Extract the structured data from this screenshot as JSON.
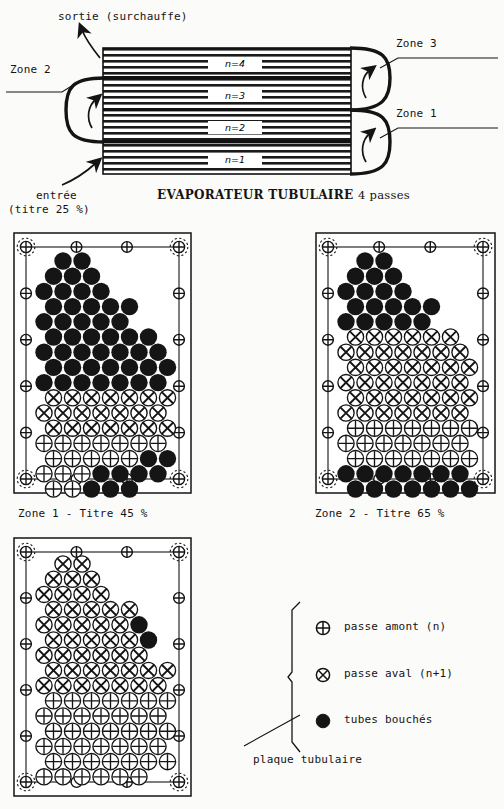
{
  "figure": {
    "title": "EVAPORATEUR TUBULAIRE 4 passes",
    "title_main": "EVAPORATEUR TUBULAIRE",
    "title_tail": "4 passes"
  },
  "schematic": {
    "outlet_label": "sortie (surchauffe)",
    "inlet_label_line1": "entrée",
    "inlet_label_line2": "(titre 25 %)",
    "zone_left": "Zone 2",
    "zone_top_right": "Zone 3",
    "zone_bottom_right": "Zone 1",
    "passes": [
      {
        "label": "n=4"
      },
      {
        "label": "n=3"
      },
      {
        "label": "n=2"
      },
      {
        "label": "n=1"
      }
    ]
  },
  "panels": [
    {
      "id": "zone1",
      "caption": "Zone 1 - Titre 45 %"
    },
    {
      "id": "zone2",
      "caption": "Zone 2 - Titre 65 %"
    },
    {
      "id": "zone3",
      "caption": ""
    }
  ],
  "legend": {
    "items": [
      {
        "symbol": "circle-plus-icon",
        "label": "passe amont (n)"
      },
      {
        "symbol": "circle-cross-icon",
        "label": "passe aval (n+1)"
      },
      {
        "symbol": "filled-circle-icon",
        "label": "tubes bouchés"
      }
    ]
  },
  "annotations": {
    "tubesheet_callout": "plaque tubulaire"
  },
  "colors": {
    "ink": "#141414",
    "paper": "#fbfbf9",
    "blocked": "#151515"
  },
  "tube_maps": {
    "legend_key": {
      "P": "passe amont (n)",
      "X": "passe aval (n+1)",
      "B": "tubes bouchés"
    },
    "zone1": [
      {
        "y": 0,
        "x0": 1,
        "cells": "BB"
      },
      {
        "y": 1,
        "x0": 0,
        "cells": "BBB"
      },
      {
        "y": 2,
        "x0": 0,
        "cells": "BBBB"
      },
      {
        "y": 3,
        "x0": 0,
        "cells": "BBBBB"
      },
      {
        "y": 4,
        "x0": 0,
        "cells": "BBBBB"
      },
      {
        "y": 5,
        "x0": 0,
        "cells": "BBBBBB"
      },
      {
        "y": 6,
        "x0": 0,
        "cells": "BBBBBBB"
      },
      {
        "y": 7,
        "x0": 0,
        "cells": "BBBBBBB"
      },
      {
        "y": 8,
        "x0": 0,
        "cells": "BBBBBBB"
      },
      {
        "y": 9,
        "x0": 0,
        "cells": "XXXXXXX"
      },
      {
        "y": 10,
        "x0": 0,
        "cells": "XXXXXXX"
      },
      {
        "y": 11,
        "x0": 0,
        "cells": "XXXXXXX"
      },
      {
        "y": 12,
        "x0": 0,
        "cells": "PPPPPPP"
      },
      {
        "y": 13,
        "x0": 0,
        "cells": "PPPPPBB"
      },
      {
        "y": 14,
        "x0": 0,
        "cells": "PPPBBBB"
      },
      {
        "y": 15,
        "x0": 0,
        "cells": "PPBBB"
      }
    ],
    "zone2": [
      {
        "y": 0,
        "x0": 1,
        "cells": "BB"
      },
      {
        "y": 1,
        "x0": 0,
        "cells": "BBB"
      },
      {
        "y": 2,
        "x0": 0,
        "cells": "BBBB"
      },
      {
        "y": 3,
        "x0": 0,
        "cells": "BBBBB"
      },
      {
        "y": 4,
        "x0": 0,
        "cells": "BBBBB"
      },
      {
        "y": 5,
        "x0": 0,
        "cells": "XXXXXX"
      },
      {
        "y": 6,
        "x0": 0,
        "cells": "XXXXXXX"
      },
      {
        "y": 7,
        "x0": 0,
        "cells": "XXXXXXX"
      },
      {
        "y": 8,
        "x0": 0,
        "cells": "XXXXXXX"
      },
      {
        "y": 9,
        "x0": 0,
        "cells": "XXXXXXX"
      },
      {
        "y": 10,
        "x0": 0,
        "cells": "XXXXXXX"
      },
      {
        "y": 11,
        "x0": 0,
        "cells": "PPPPPPP"
      },
      {
        "y": 12,
        "x0": 0,
        "cells": "PPPPPPP"
      },
      {
        "y": 13,
        "x0": 0,
        "cells": "PPPPPPP"
      },
      {
        "y": 14,
        "x0": 0,
        "cells": "BBBBBBB"
      },
      {
        "y": 15,
        "x0": 0,
        "cells": "BBBBBBB"
      }
    ],
    "zone3": [
      {
        "y": 0,
        "x0": 1,
        "cells": "XX"
      },
      {
        "y": 1,
        "x0": 0,
        "cells": "XXX"
      },
      {
        "y": 2,
        "x0": 0,
        "cells": "XXXX"
      },
      {
        "y": 3,
        "x0": 0,
        "cells": "XXXXX"
      },
      {
        "y": 4,
        "x0": 0,
        "cells": "XXXXXB"
      },
      {
        "y": 5,
        "x0": 0,
        "cells": "XXXXXB"
      },
      {
        "y": 6,
        "x0": 0,
        "cells": "XXXXXX"
      },
      {
        "y": 7,
        "x0": 0,
        "cells": "XXXXXXX"
      },
      {
        "y": 8,
        "x0": 0,
        "cells": "XXXXXXX"
      },
      {
        "y": 9,
        "x0": 0,
        "cells": "PPPPPPP"
      },
      {
        "y": 10,
        "x0": 0,
        "cells": "PPPPPPP"
      },
      {
        "y": 11,
        "x0": 0,
        "cells": "PPPPPPP"
      },
      {
        "y": 12,
        "x0": 0,
        "cells": "PPPPPPP"
      },
      {
        "y": 13,
        "x0": 0,
        "cells": "PPPPPPP"
      },
      {
        "y": 14,
        "x0": 0,
        "cells": "PPPPPP"
      }
    ]
  }
}
